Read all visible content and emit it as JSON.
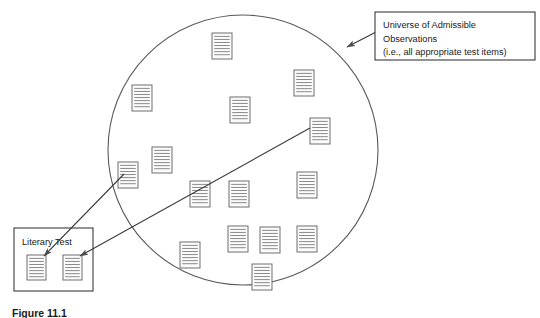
{
  "figure": {
    "caption": "Figure 11.1",
    "background_color": "#ffffff",
    "line_color": "#5a5a5a",
    "text_color": "#1a1a1a",
    "item_fill_color": "#fbfbfb",
    "item_line_color": "#8a8a8a",
    "item_border_color": "#6e6e6e"
  },
  "universe": {
    "shape": "circle",
    "center_x": 243,
    "center_y": 150,
    "radius": 135
  },
  "annotation": {
    "lines": [
      "Universe of Admissible",
      "Observations",
      "(i.e., all appropriate test items)"
    ],
    "box": {
      "x": 375,
      "y": 12,
      "width": 160,
      "height": 48
    },
    "arrow": {
      "x1": 376,
      "y1": 32,
      "x2": 347,
      "y2": 47
    }
  },
  "test_box": {
    "label": "Literary Test",
    "box": {
      "x": 14,
      "y": 228,
      "width": 79,
      "height": 63
    },
    "label_x": 22,
    "label_y": 245
  },
  "universe_items": [
    {
      "id": "item-1",
      "x": 212,
      "y": 33,
      "width": 20,
      "height": 26
    },
    {
      "id": "item-2",
      "x": 230,
      "y": 97,
      "width": 20,
      "height": 26
    },
    {
      "id": "item-3",
      "x": 132,
      "y": 85,
      "width": 20,
      "height": 26
    },
    {
      "id": "item-4",
      "x": 294,
      "y": 70,
      "width": 20,
      "height": 26
    },
    {
      "id": "item-5",
      "x": 310,
      "y": 118,
      "width": 20,
      "height": 26
    },
    {
      "id": "item-6",
      "x": 152,
      "y": 147,
      "width": 20,
      "height": 26
    },
    {
      "id": "item-7",
      "x": 118,
      "y": 162,
      "width": 20,
      "height": 26
    },
    {
      "id": "item-8",
      "x": 190,
      "y": 181,
      "width": 20,
      "height": 26
    },
    {
      "id": "item-9",
      "x": 229,
      "y": 181,
      "width": 20,
      "height": 26
    },
    {
      "id": "item-10",
      "x": 297,
      "y": 172,
      "width": 20,
      "height": 26
    },
    {
      "id": "item-11",
      "x": 228,
      "y": 226,
      "width": 20,
      "height": 26
    },
    {
      "id": "item-12",
      "x": 260,
      "y": 227,
      "width": 20,
      "height": 26
    },
    {
      "id": "item-13",
      "x": 297,
      "y": 226,
      "width": 20,
      "height": 26
    },
    {
      "id": "item-14",
      "x": 180,
      "y": 242,
      "width": 20,
      "height": 26
    },
    {
      "id": "item-15",
      "x": 252,
      "y": 264,
      "width": 20,
      "height": 26
    }
  ],
  "test_items": [
    {
      "id": "test-item-1",
      "x": 27,
      "y": 255,
      "width": 19,
      "height": 25
    },
    {
      "id": "test-item-2",
      "x": 63,
      "y": 255,
      "width": 19,
      "height": 25
    }
  ],
  "sampling_arrows": [
    {
      "id": "arrow-from-item-7",
      "x1": 124,
      "y1": 174,
      "x2": 44,
      "y2": 256
    },
    {
      "id": "arrow-from-item-5",
      "x1": 310,
      "y1": 128,
      "x2": 80,
      "y2": 256
    }
  ]
}
